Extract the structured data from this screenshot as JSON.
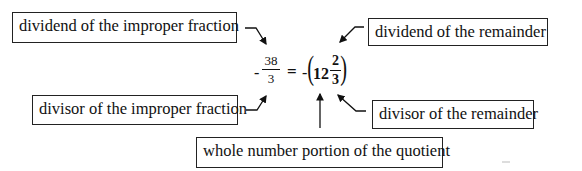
{
  "labels": {
    "dividend_improper": "dividend of the improper fraction",
    "divisor_improper": "divisor of the improper fraction",
    "dividend_remainder": "dividend of the remainder",
    "divisor_remainder": "divisor of the remainder",
    "whole_number": "whole number portion of the quotient"
  },
  "equation": {
    "left_sign": "-",
    "left_numerator": "38",
    "left_denominator": "3",
    "equals": "=",
    "right_sign": "-",
    "open_paren": "(",
    "whole": "12",
    "right_numerator": "2",
    "right_denominator": "3",
    "close_paren": ")"
  },
  "colors": {
    "ink": "#111111",
    "background": "#ffffff"
  }
}
